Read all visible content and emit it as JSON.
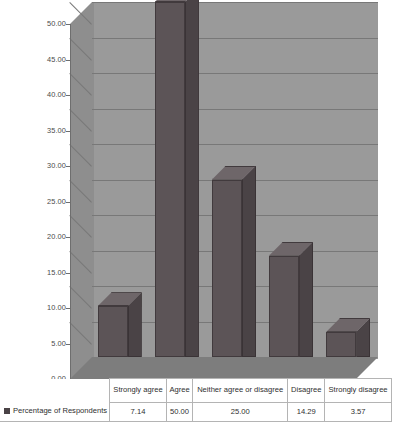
{
  "chart_data": {
    "type": "bar",
    "title": "",
    "xlabel": "",
    "ylabel": "",
    "ylim": [
      0,
      50
    ],
    "ytick_step": 5,
    "grid": true,
    "legend_position": "bottom-table",
    "categories": [
      "Strongly agree",
      "Agree",
      "Neither agree or disagree",
      "Disagree",
      "Strongly disagree"
    ],
    "series": [
      {
        "name": "Percentage of Respondents",
        "values": [
          7.14,
          50.0,
          25.0,
          14.29,
          3.57
        ],
        "value_labels": [
          "7.14",
          "50.00",
          "25.00",
          "14.29",
          "3.57"
        ]
      }
    ],
    "ytick_labels": [
      "0.00",
      "5.00",
      "10.00",
      "15.00",
      "20.00",
      "25.00",
      "30.00",
      "35.00",
      "40.00",
      "45.00",
      "50.00"
    ],
    "colors": {
      "bar_front": "#5c5457",
      "bar_side": "#4a4346",
      "bar_top": "#6e6669",
      "back_wall": "#9a9a9a",
      "left_wall": "#8e8e8e",
      "floor": "#7d7d7d",
      "gridline": "#787878",
      "axis": "#6e6e6e",
      "table_border": "#b4b4b4",
      "text": "#2f2f2f"
    }
  },
  "table": {
    "legend_label": "Percentage of Respondents",
    "legend_marker": "square-marker-icon",
    "headers": [
      "Strongly agree",
      "Agree",
      "Neither agree or disagree",
      "Disagree",
      "Strongly disagree"
    ],
    "values": [
      "7.14",
      "50.00",
      "25.00",
      "14.29",
      "3.57"
    ]
  }
}
